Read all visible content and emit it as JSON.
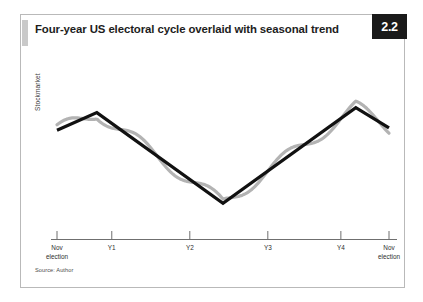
{
  "figure": {
    "title": "Four-year US electoral cycle overlaid with seasonal trend",
    "number": "2.2",
    "source_note": "Source: Author",
    "badge_color": "#1a1a1a",
    "frame_color": "#b9b9b9",
    "tab_color": "#c9c9c9"
  },
  "chart_data": {
    "type": "line",
    "title": "Four-year US electoral cycle overlaid with seasonal trend",
    "xlabel": "",
    "ylabel": "Stockmarket",
    "grid": false,
    "legend": "none",
    "axis": {
      "x_tick_count": 6,
      "x_tick_labels": [
        "Nov\nelection",
        "Y1",
        "Y2",
        "Y3",
        "Y4",
        "Nov\nelection"
      ],
      "y_tick_labels": [],
      "y_axis_visible": false,
      "x_axis_visible": true
    },
    "tick_labels": [
      {
        "label": "Nov\nelection",
        "x_frac": 0.0
      },
      {
        "label": "Y1",
        "x_frac": 0.165
      },
      {
        "label": "Y2",
        "x_frac": 0.4
      },
      {
        "label": "Y3",
        "x_frac": 0.635
      },
      {
        "label": "Y4",
        "x_frac": 0.855
      },
      {
        "label": "Nov\nelection",
        "x_frac": 1.0
      }
    ],
    "series": [
      {
        "name": "Electoral cycle trend",
        "style": "solid",
        "color": "#111111",
        "width": 3.2,
        "points": [
          {
            "x": 0.0,
            "y": 0.72
          },
          {
            "x": 0.12,
            "y": 0.86
          },
          {
            "x": 0.5,
            "y": 0.14
          },
          {
            "x": 0.9,
            "y": 0.9
          },
          {
            "x": 1.0,
            "y": 0.74
          }
        ]
      },
      {
        "name": "Seasonal trend",
        "style": "solid",
        "color": "#b3b3b3",
        "width": 3.2,
        "description": "Sinusoidal seasonal oscillation overlaid on the electoral cycle trend",
        "oscillation": {
          "cycles": 4.5,
          "amplitude": 0.055
        }
      }
    ]
  }
}
